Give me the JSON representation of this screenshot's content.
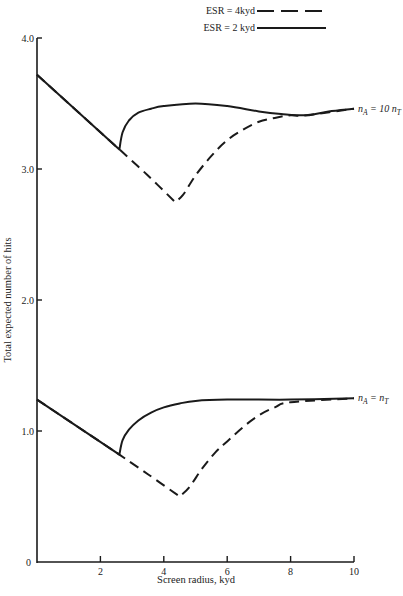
{
  "chart_data": {
    "type": "line",
    "title": "",
    "xlabel": "Screen radius, kyd",
    "ylabel": "Total expected number of hits",
    "xlim": [
      0,
      10
    ],
    "ylim": [
      0,
      4.0
    ],
    "x_ticks": [
      "2",
      "4",
      "6",
      "8",
      "10"
    ],
    "y_ticks": [
      "0",
      "1.0",
      "2.0",
      "3.0",
      "4.0"
    ],
    "grid": false,
    "legend": {
      "position": "top-right",
      "entries": [
        {
          "label": "ESR = 4kyd",
          "style": "dashed"
        },
        {
          "label": "ESR = 2 kyd",
          "style": "solid"
        }
      ]
    },
    "annotations": [
      {
        "text": "nA = 10 nT",
        "attached_to": "upper curves"
      },
      {
        "text": "nA = nT",
        "attached_to": "lower curves"
      }
    ],
    "series": [
      {
        "name": "ESR = 2 kyd, nA = 10 nT",
        "style": "solid",
        "x": [
          0,
          2.6,
          2.7,
          2.9,
          3.2,
          3.6,
          4.0,
          5.0,
          6.0,
          7.0,
          7.7,
          8.5,
          9.2,
          10
        ],
        "y": [
          3.72,
          3.15,
          3.28,
          3.37,
          3.43,
          3.46,
          3.48,
          3.5,
          3.48,
          3.44,
          3.42,
          3.41,
          3.44,
          3.46
        ]
      },
      {
        "name": "ESR = 4 kyd, nA = 10 nT",
        "style": "dashed",
        "x": [
          0,
          2.6,
          3.5,
          4.35,
          4.6,
          5.0,
          5.5,
          6.0,
          6.5,
          7.0,
          7.5,
          8.0,
          8.5,
          10
        ],
        "y": [
          3.72,
          3.15,
          2.95,
          2.75,
          2.8,
          2.95,
          3.1,
          3.22,
          3.3,
          3.36,
          3.39,
          3.41,
          3.41,
          3.46
        ]
      },
      {
        "name": "ESR = 2 kyd, nA = nT",
        "style": "solid",
        "x": [
          0,
          2.6,
          2.7,
          2.9,
          3.2,
          3.6,
          4.0,
          4.5,
          5.0,
          6.0,
          8.0,
          10
        ],
        "y": [
          1.24,
          0.82,
          0.93,
          1.01,
          1.08,
          1.14,
          1.18,
          1.21,
          1.23,
          1.24,
          1.24,
          1.25
        ]
      },
      {
        "name": "ESR = 4 kyd, nA = nT",
        "style": "dashed",
        "x": [
          0,
          2.6,
          3.5,
          4.5,
          4.8,
          5.2,
          5.6,
          6.0,
          6.5,
          7.0,
          7.5,
          8.0,
          10
        ],
        "y": [
          1.24,
          0.82,
          0.67,
          0.5,
          0.57,
          0.71,
          0.83,
          0.92,
          1.03,
          1.12,
          1.18,
          1.22,
          1.25
        ]
      }
    ]
  },
  "labels": {
    "xlabel": "Screen radius, kyd",
    "ylabel": "Total expected number of hits",
    "legend_dashed": "ESR = 4kyd",
    "legend_solid": "ESR = 2 kyd",
    "upper_series_label": "nA = 10 nT",
    "lower_series_label": "nA = nT",
    "x_ticks": [
      "2",
      "4",
      "6",
      "8",
      "10"
    ],
    "x_zero": "0",
    "y_ticks": [
      "1.0",
      "2.0",
      "3.0",
      "4.0"
    ]
  },
  "colors": {
    "line": "#1a1a1a",
    "background": "#ffffff"
  }
}
